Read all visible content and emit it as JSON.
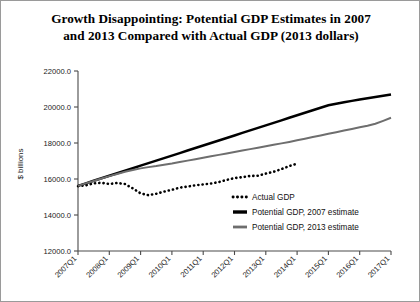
{
  "chart_data": {
    "type": "line",
    "title": "Growth Disappointing: Potential GDP Estimates in 2007 and 2013 Compared with Actual GDP (2013 dollars)",
    "title_lines": [
      "Growth Disappointing: Potential GDP Estimates in 2007",
      "and 2013 Compared with Actual GDP (2013 dollars)"
    ],
    "xlabel": "",
    "ylabel": "$ billions",
    "ylim": [
      12000,
      22000
    ],
    "ytick_values": [
      12000,
      14000,
      16000,
      18000,
      20000,
      22000
    ],
    "ytick_labels": [
      "12000.0",
      "14000.0",
      "16000.0",
      "18000.0",
      "20000.0",
      "22000.0"
    ],
    "xtick_labels": [
      "2007Q1",
      "2008Q1",
      "2009Q1",
      "2010Q1",
      "2011Q1",
      "2012Q1",
      "2013Q1",
      "2014Q1",
      "2015Q1",
      "2016Q1",
      "2017Q1"
    ],
    "x_quarters": [
      "2007Q1",
      "2007Q2",
      "2007Q3",
      "2007Q4",
      "2008Q1",
      "2008Q2",
      "2008Q3",
      "2008Q4",
      "2009Q1",
      "2009Q2",
      "2009Q3",
      "2009Q4",
      "2010Q1",
      "2010Q2",
      "2010Q3",
      "2010Q4",
      "2011Q1",
      "2011Q2",
      "2011Q3",
      "2011Q4",
      "2012Q1",
      "2012Q2",
      "2012Q3",
      "2012Q4",
      "2013Q1",
      "2013Q2",
      "2013Q3",
      "2013Q4",
      "2014Q1",
      "2014Q2",
      "2014Q3",
      "2014Q4",
      "2015Q1",
      "2015Q2",
      "2015Q3",
      "2015Q4",
      "2016Q1",
      "2016Q2",
      "2016Q3",
      "2016Q4",
      "2017Q1"
    ],
    "grid": false,
    "legend_position": "inside-lower-right",
    "series": [
      {
        "name": "Actual GDP",
        "style": "dotted",
        "color": "#000000",
        "values": [
          15600,
          15650,
          15760,
          15790,
          15720,
          15780,
          15720,
          15480,
          15200,
          15100,
          15180,
          15300,
          15400,
          15520,
          15580,
          15650,
          15700,
          15750,
          15830,
          15950,
          16050,
          16100,
          16170,
          16180,
          16300,
          16400,
          16550,
          16720,
          16850,
          null,
          null,
          null,
          null,
          null,
          null,
          null,
          null,
          null,
          null,
          null,
          null
        ]
      },
      {
        "name": "Potential GDP, 2007 estimate",
        "style": "solid-thick",
        "color": "#000000",
        "values": [
          15620,
          15760,
          15900,
          16040,
          16180,
          16320,
          16460,
          16600,
          16740,
          16880,
          17020,
          17160,
          17300,
          17440,
          17580,
          17720,
          17860,
          18000,
          18140,
          18280,
          18420,
          18560,
          18700,
          18840,
          18980,
          19120,
          19260,
          19400,
          19540,
          19680,
          19820,
          19960,
          20100,
          20180,
          20260,
          20340,
          20420,
          20490,
          20560,
          20630,
          20700
        ]
      },
      {
        "name": "Potential GDP, 2013 estimate",
        "style": "solid-gray",
        "color": "#6e6e6e",
        "values": [
          15620,
          15755,
          15890,
          16025,
          16160,
          16280,
          16400,
          16500,
          16590,
          16660,
          16720,
          16790,
          16860,
          16940,
          17020,
          17100,
          17180,
          17260,
          17340,
          17420,
          17500,
          17580,
          17660,
          17740,
          17820,
          17900,
          17980,
          18060,
          18150,
          18240,
          18330,
          18420,
          18510,
          18600,
          18690,
          18780,
          18870,
          18960,
          19070,
          19230,
          19400
        ]
      }
    ],
    "legend_entries": [
      {
        "label": "Actual GDP",
        "style": "dotted",
        "color": "#000000"
      },
      {
        "label": "Potential GDP, 2007 estimate",
        "style": "solid-thick",
        "color": "#000000"
      },
      {
        "label": "Potential GDP, 2013 estimate",
        "style": "solid-gray",
        "color": "#6e6e6e"
      }
    ]
  }
}
